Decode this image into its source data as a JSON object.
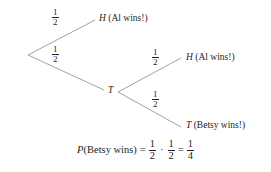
{
  "diagram": {
    "type": "probability-tree",
    "root": {
      "branches": [
        {
          "id": "branch-top",
          "probability": {
            "numerator": "1",
            "denominator": "2"
          },
          "outcome_symbol": "H",
          "outcome_text": "(Al wins!)"
        },
        {
          "id": "branch-bottom",
          "probability": {
            "numerator": "1",
            "denominator": "2"
          },
          "outcome_symbol": "T",
          "outcome_text": "",
          "children": [
            {
              "id": "branch-t-top",
              "probability": {
                "numerator": "1",
                "denominator": "2"
              },
              "outcome_symbol": "H",
              "outcome_text": "(Al wins!)"
            },
            {
              "id": "branch-t-bottom",
              "probability": {
                "numerator": "1",
                "denominator": "2"
              },
              "outcome_symbol": "T",
              "outcome_text": "(Betsy wins!)"
            }
          ]
        }
      ]
    },
    "equation": {
      "p_symbol": "P",
      "event": "(Betsy wins)",
      "equals": "=",
      "factor1": {
        "numerator": "1",
        "denominator": "2"
      },
      "multiply": "·",
      "factor2": {
        "numerator": "1",
        "denominator": "2"
      },
      "equals2": "=",
      "result": {
        "numerator": "1",
        "denominator": "4"
      }
    },
    "colors": {
      "ink": "#231f20",
      "line": "#8c8c8c",
      "background": "#ffffff"
    }
  }
}
